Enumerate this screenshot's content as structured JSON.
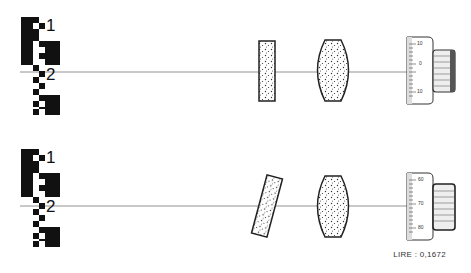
{
  "diagram": {
    "type": "optical-setup",
    "panels": [
      {
        "id": "top",
        "axis_y": 72,
        "target_labels": [
          "1",
          "2"
        ],
        "plate": {
          "tilted": false,
          "angle_deg": 0
        },
        "lens": {
          "shape": "biconvex"
        },
        "micrometer": {
          "scale_labels": [
            "10",
            "0",
            "10"
          ]
        }
      },
      {
        "id": "bottom",
        "axis_y": 206,
        "target_labels": [
          "1",
          "2"
        ],
        "plate": {
          "tilted": true,
          "angle_deg": 15
        },
        "lens": {
          "shape": "biconvex"
        },
        "micrometer": {
          "scale_labels": [
            "60",
            "70",
            "80"
          ]
        }
      }
    ],
    "caption": "LIRE : 0,1672",
    "colors": {
      "ink": "#111111",
      "axis": "#777777",
      "background": "#ffffff"
    }
  }
}
